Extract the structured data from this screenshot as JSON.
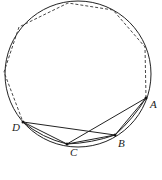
{
  "diagram": {
    "type": "circle-inscribed-polygon",
    "circle": {
      "cx": 78,
      "cy": 74,
      "r": 73
    },
    "points": {
      "A": {
        "label": "A",
        "x": 146,
        "y": 98
      },
      "B": {
        "label": "B",
        "x": 115,
        "y": 135
      },
      "C": {
        "label": "C",
        "x": 67,
        "y": 144
      },
      "D": {
        "label": "D",
        "x": 23,
        "y": 122
      }
    },
    "solid_segments": [
      "DB",
      "DC",
      "CB",
      "CA",
      "BA"
    ],
    "dashed_polyline_vertices": [
      [
        146,
        98
      ],
      [
        145,
        47
      ],
      [
        113,
        10
      ],
      [
        68,
        3
      ],
      [
        19,
        27
      ],
      [
        4,
        72
      ],
      [
        23,
        122
      ]
    ],
    "colors": {
      "stroke": "#222222",
      "background": "#ffffff"
    }
  }
}
